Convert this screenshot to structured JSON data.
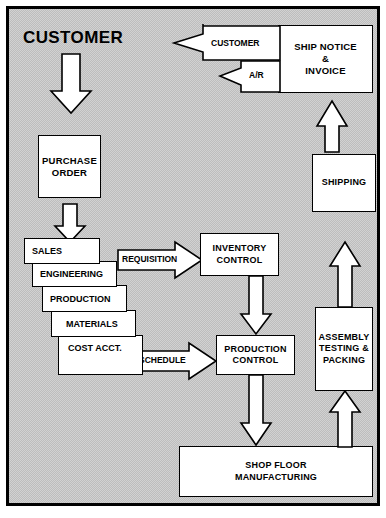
{
  "diagram": {
    "type": "flowchart",
    "title_label": "CUSTOMER",
    "background_color": "#d2d2d2",
    "box_fill_color": "#ffffff",
    "line_color": "#000000",
    "nodes": [
      {
        "id": "purchase_order",
        "label": "PURCHASE\nORDER",
        "line1": "PURCHASE",
        "line2": "ORDER"
      },
      {
        "id": "inventory_control",
        "label": "INVENTORY\nCONTROL",
        "line1": "INVENTORY",
        "line2": "CONTROL"
      },
      {
        "id": "production_control",
        "label": "PRODUCTION\nCONTROL",
        "line1": "PRODUCTION",
        "line2": "CONTROL"
      },
      {
        "id": "shop_floor",
        "label": "SHOP FLOOR\nMANUFACTURING",
        "line1": "SHOP FLOOR",
        "line2": "MANUFACTURING"
      },
      {
        "id": "assembly",
        "label": "ASSEMBLY\nTESTING &\nPACKING",
        "line1": "ASSEMBLY",
        "line2": "TESTING &",
        "line3": "PACKING"
      },
      {
        "id": "shipping",
        "label": "SHIPPING",
        "line1": "SHIPPING"
      },
      {
        "id": "ship_notice",
        "label": "SHIP NOTICE\n&\nINVOICE",
        "line1": "SHIP NOTICE",
        "line2": "&",
        "line3": "INVOICE"
      }
    ],
    "department_stack": [
      {
        "id": "sales",
        "label": "SALES"
      },
      {
        "id": "engineering",
        "label": "ENGINEERING"
      },
      {
        "id": "production",
        "label": "PRODUCTION"
      },
      {
        "id": "materials",
        "label": "MATERIALS"
      },
      {
        "id": "cost_acct",
        "label": "COST ACCT."
      }
    ],
    "arrows": [
      {
        "id": "customer_to_purchase_order",
        "label": "",
        "direction": "down"
      },
      {
        "id": "purchase_order_to_sales",
        "label": "",
        "direction": "down"
      },
      {
        "id": "requisition",
        "label": "REQUISITION",
        "direction": "right"
      },
      {
        "id": "schedule",
        "label": "SCHEDULE",
        "direction": "right"
      },
      {
        "id": "inventory_to_production",
        "label": "",
        "direction": "down"
      },
      {
        "id": "production_to_shop_floor",
        "label": "",
        "direction": "down"
      },
      {
        "id": "shop_floor_to_assembly",
        "label": "",
        "direction": "up"
      },
      {
        "id": "assembly_to_shipping",
        "label": "",
        "direction": "up"
      },
      {
        "id": "shipping_to_ship_notice",
        "label": "",
        "direction": "up"
      },
      {
        "id": "ship_notice_to_customer",
        "label": "CUSTOMER",
        "direction": "left"
      },
      {
        "id": "ship_notice_to_ar",
        "label": "A/R",
        "direction": "left"
      }
    ]
  }
}
